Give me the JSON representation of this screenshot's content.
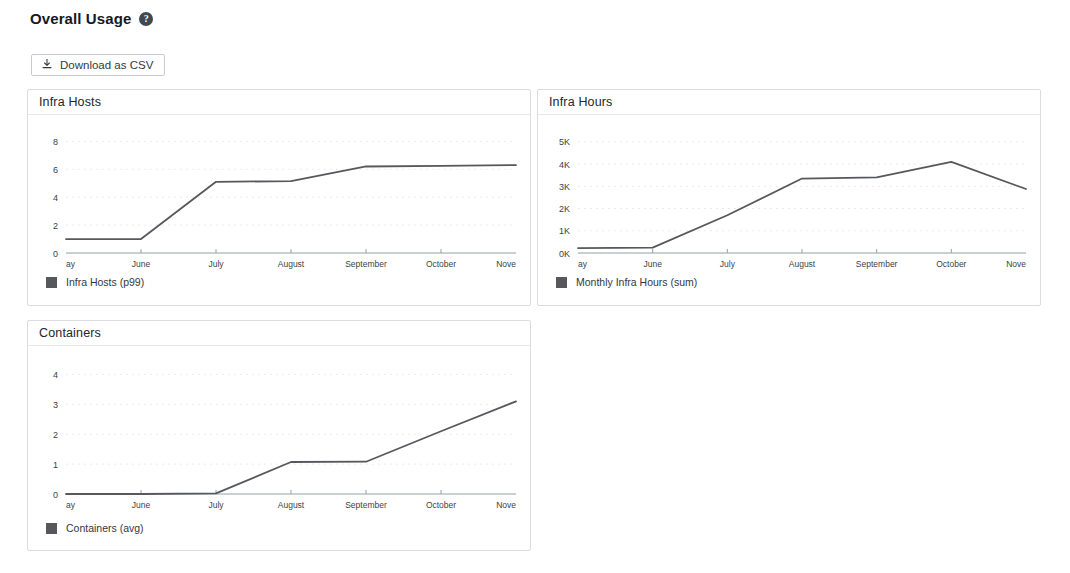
{
  "header": {
    "title": "Overall Usage",
    "help_icon": "question-mark-circle-icon"
  },
  "toolbar": {
    "download_label": "Download as CSV",
    "download_icon": "download-tray-icon"
  },
  "theme": {
    "line_color": "#56585b",
    "axis_color": "#9aa0a6",
    "grid_color": "#e9ebed",
    "panel_border": "#d9dce0",
    "text_color": "#33373c"
  },
  "charts": [
    {
      "id": "infra-hosts",
      "title": "Infra Hosts",
      "legend": "Infra Hosts (p99)",
      "chart_data": {
        "type": "line",
        "title": "Infra Hosts",
        "xlabel": "",
        "ylabel": "",
        "grid": true,
        "legend_position": "bottom-left",
        "x": [
          "ay",
          "June",
          "July",
          "August",
          "September",
          "October",
          "Nove"
        ],
        "x_full": [
          "May",
          "June",
          "July",
          "August",
          "September",
          "October",
          "November"
        ],
        "xticklabels": [
          "ay",
          "June",
          "July",
          "August",
          "September",
          "October",
          "Nove"
        ],
        "yticklabels": [
          "0",
          "2",
          "4",
          "6",
          "8"
        ],
        "yticks": [
          0,
          2,
          4,
          6,
          8
        ],
        "ylim": [
          0,
          8.6
        ],
        "series": [
          {
            "name": "Infra Hosts (p99)",
            "values": [
              1.0,
              1.0,
              5.1,
              5.15,
              6.2,
              6.25,
              6.3
            ]
          }
        ]
      }
    },
    {
      "id": "infra-hours",
      "title": "Infra Hours",
      "legend": "Monthly Infra Hours (sum)",
      "chart_data": {
        "type": "line",
        "title": "Infra Hours",
        "xlabel": "",
        "ylabel": "",
        "grid": true,
        "legend_position": "bottom-left",
        "x": [
          "ay",
          "June",
          "July",
          "August",
          "September",
          "October",
          "Nove"
        ],
        "x_full": [
          "May",
          "June",
          "July",
          "August",
          "September",
          "October",
          "November"
        ],
        "xticklabels": [
          "ay",
          "June",
          "July",
          "August",
          "September",
          "October",
          "Nove"
        ],
        "yticklabels": [
          "0K",
          "1K",
          "2K",
          "3K",
          "4K",
          "5K"
        ],
        "yticks": [
          0,
          1000,
          2000,
          3000,
          4000,
          5000
        ],
        "ylim": [
          0,
          5400
        ],
        "series": [
          {
            "name": "Monthly Infra Hours (sum)",
            "values": [
              220,
              240,
              1700,
              3350,
              3400,
              4100,
              2880
            ]
          }
        ]
      }
    },
    {
      "id": "containers",
      "title": "Containers",
      "legend": "Containers (avg)",
      "chart_data": {
        "type": "line",
        "title": "Containers",
        "xlabel": "",
        "ylabel": "",
        "grid": true,
        "legend_position": "bottom-left",
        "x": [
          "ay",
          "June",
          "July",
          "August",
          "September",
          "October",
          "Nove"
        ],
        "x_full": [
          "May",
          "June",
          "July",
          "August",
          "September",
          "October",
          "November"
        ],
        "xticklabels": [
          "ay",
          "June",
          "July",
          "August",
          "September",
          "October",
          "Nove"
        ],
        "yticklabels": [
          "0",
          "1",
          "2",
          "3",
          "4"
        ],
        "yticks": [
          0,
          1,
          2,
          3,
          4
        ],
        "ylim": [
          0,
          4.35
        ],
        "series": [
          {
            "name": "Containers (avg)",
            "values": [
              0.0,
              0.0,
              0.02,
              1.07,
              1.08,
              2.1,
              3.1
            ]
          }
        ]
      }
    }
  ]
}
